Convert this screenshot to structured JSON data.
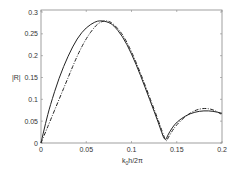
{
  "chart_data": {
    "type": "line",
    "title": "",
    "xlabel": "k_0 h/2π",
    "ylabel": "|R|",
    "xlim": [
      0,
      0.2
    ],
    "ylim": [
      0,
      0.3
    ],
    "grid": false,
    "legend": null,
    "x_ticks": [
      "0",
      "0.05",
      "0.1",
      "0.15",
      "0.2"
    ],
    "y_ticks": [
      "0",
      "0.05",
      "0.1",
      "0.15",
      "0.2",
      "0.25",
      "0.3"
    ],
    "series": [
      {
        "name": "solid",
        "style": "solid",
        "color": "#222222",
        "x": [
          0,
          0.005,
          0.01,
          0.02,
          0.03,
          0.04,
          0.05,
          0.06,
          0.065,
          0.07,
          0.075,
          0.08,
          0.09,
          0.1,
          0.11,
          0.12,
          0.13,
          0.137,
          0.14,
          0.145,
          0.15,
          0.16,
          0.17,
          0.18,
          0.19,
          0.2
        ],
        "values": [
          0,
          0.045,
          0.085,
          0.15,
          0.2,
          0.24,
          0.265,
          0.278,
          0.28,
          0.279,
          0.276,
          0.27,
          0.245,
          0.205,
          0.155,
          0.1,
          0.045,
          0.002,
          0.018,
          0.035,
          0.048,
          0.063,
          0.071,
          0.074,
          0.073,
          0.068
        ]
      },
      {
        "name": "dash-dot",
        "style": "dashdot",
        "color": "#222222",
        "x": [
          0,
          0.005,
          0.01,
          0.02,
          0.03,
          0.04,
          0.05,
          0.06,
          0.065,
          0.07,
          0.075,
          0.08,
          0.09,
          0.1,
          0.11,
          0.12,
          0.13,
          0.138,
          0.14,
          0.145,
          0.15,
          0.16,
          0.17,
          0.18,
          0.19,
          0.2
        ],
        "values": [
          0,
          0.025,
          0.05,
          0.1,
          0.15,
          0.2,
          0.24,
          0.268,
          0.276,
          0.28,
          0.279,
          0.273,
          0.25,
          0.21,
          0.16,
          0.105,
          0.05,
          0.002,
          0.01,
          0.028,
          0.042,
          0.062,
          0.075,
          0.08,
          0.077,
          0.065
        ]
      }
    ]
  },
  "axes": {
    "x_label_main": "k",
    "x_label_sub": "0",
    "x_label_rest": "h/2π",
    "y_label": "|R|"
  }
}
